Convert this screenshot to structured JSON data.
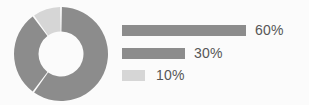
{
  "background_color": "#fbfbfb",
  "chart_data": {
    "type": "pie",
    "variant": "donut",
    "title": "",
    "subtitle": "",
    "xlabel": "",
    "ylabel": "",
    "grid": false,
    "legend_position": "right",
    "categories": [
      "60%",
      "30%",
      "10%"
    ],
    "values": [
      60,
      30,
      10
    ],
    "labels": [
      "60%",
      "30%",
      "10%"
    ],
    "colors": [
      "#8c8c8c",
      "#8c8c8c",
      "#d6d6d6"
    ],
    "slice_gap_color": "#fbfbfb",
    "inner_radius_ratio": 0.48,
    "start_angle_deg": -90,
    "text_color": "#565656",
    "slices": [
      {
        "label": "60%",
        "value": 60,
        "color": "#8c8c8c",
        "start_angle_deg": -90,
        "end_angle_deg": 126
      },
      {
        "label": "30%",
        "value": 30,
        "color": "#8c8c8c",
        "start_angle_deg": 126,
        "end_angle_deg": 234
      },
      {
        "label": "10%",
        "value": 10,
        "color": "#d6d6d6",
        "start_angle_deg": 234,
        "end_angle_deg": 270
      }
    ]
  },
  "donut": {
    "name": "donut-chart",
    "center_x": 48,
    "center_y": 48,
    "outer_radius": 47,
    "inner_radius": 22.5
  },
  "legend": {
    "title": "",
    "rows": [
      {
        "label": "60%",
        "value": 60,
        "bar_color": "#8c8c8c",
        "bar_width_px": 124
      },
      {
        "label": "30%",
        "value": 30,
        "bar_color": "#8c8c8c",
        "bar_width_px": 63
      },
      {
        "label": "10%",
        "value": 10,
        "bar_color": "#d6d6d6",
        "bar_width_px": 23
      }
    ]
  }
}
